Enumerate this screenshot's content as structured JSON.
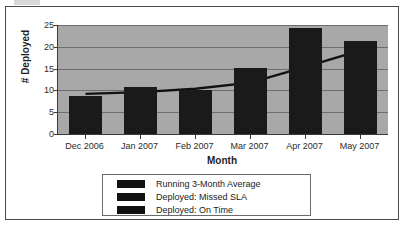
{
  "chart_data": {
    "type": "bar",
    "title": "",
    "xlabel": "Month",
    "ylabel": "# Deployed",
    "categories": [
      "Dec 2006",
      "Jan 2007",
      "Feb 2007",
      "Mar 2007",
      "Apr 2007",
      "May 2007"
    ],
    "ylim": [
      0,
      25
    ],
    "yticks": [
      0,
      5,
      10,
      15,
      20,
      25
    ],
    "grid": true,
    "legend_position": "bottom",
    "series": [
      {
        "name": "Deployed: On Time",
        "type": "bar",
        "values": [
          8.8,
          10.8,
          10.0,
          15.2,
          24.4,
          21.4
        ],
        "color": "#1a1a1a"
      },
      {
        "name": "Deployed: Missed SLA",
        "type": "bar",
        "values": [
          0,
          0,
          0,
          0,
          0,
          0
        ],
        "color": "#1a1a1a"
      },
      {
        "name": "Running 3-Month Average",
        "type": "line",
        "values": [
          9.2,
          9.6,
          10.4,
          11.8,
          15.4,
          19.2
        ],
        "color": "#111111"
      }
    ],
    "plot_background": "#a8a8a8",
    "gridline_color": "#6e6e6e",
    "frame_color": "#4a4a4a"
  },
  "legend": {
    "items": [
      {
        "label": "Running 3-Month Average",
        "color": "#111111"
      },
      {
        "label": "Deployed: Missed SLA",
        "color": "#111111"
      },
      {
        "label": "Deployed: On Time",
        "color": "#111111"
      }
    ]
  },
  "axes": {
    "y_tick_labels": [
      "25",
      "20",
      "15",
      "10",
      "5",
      "0"
    ],
    "y_title": "# Deployed",
    "x_title": "Month",
    "x_tick_labels": [
      "Dec 2006",
      "Jan 2007",
      "Feb 2007",
      "Mar 2007",
      "Apr 2007",
      "May 2007"
    ]
  }
}
